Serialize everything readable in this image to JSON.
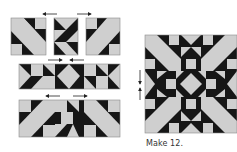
{
  "diagram": {
    "type": "quilt-block-assembly",
    "colors": {
      "dark": "#161616",
      "light": "#cfcfcf",
      "seam": "#8a8a8a",
      "arrow": "#222222"
    },
    "caption": "Make 12.",
    "units": [
      {
        "id": "top-left-unit",
        "row": "top"
      },
      {
        "id": "top-center-unit",
        "row": "top"
      },
      {
        "id": "top-right-unit",
        "row": "top"
      },
      {
        "id": "middle-row-unit",
        "row": "middle"
      },
      {
        "id": "bottom-row-unit",
        "row": "bottom"
      },
      {
        "id": "finished-block",
        "row": "result"
      }
    ],
    "pressing_arrows": [
      {
        "id": "arrow-top-left",
        "direction": "left"
      },
      {
        "id": "arrow-top-right",
        "direction": "right"
      },
      {
        "id": "arrow-middle-right",
        "direction": "right"
      },
      {
        "id": "arrow-middle-left",
        "direction": "left"
      },
      {
        "id": "arrow-bottom-left",
        "direction": "left"
      },
      {
        "id": "arrow-bottom-right",
        "direction": "right"
      },
      {
        "id": "arrow-block-down",
        "direction": "down"
      },
      {
        "id": "arrow-block-up",
        "direction": "up"
      }
    ]
  }
}
